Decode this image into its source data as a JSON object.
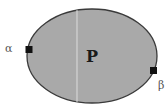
{
  "diagram": {
    "region_label": "P",
    "points": [
      {
        "label": "α",
        "position": "left"
      },
      {
        "label": "β",
        "position": "lower-right"
      }
    ],
    "colors": {
      "fill": "#a9a9a9",
      "stroke": "#3a3a3a",
      "marker": "#111111",
      "divider": "#dcdcdc"
    }
  }
}
